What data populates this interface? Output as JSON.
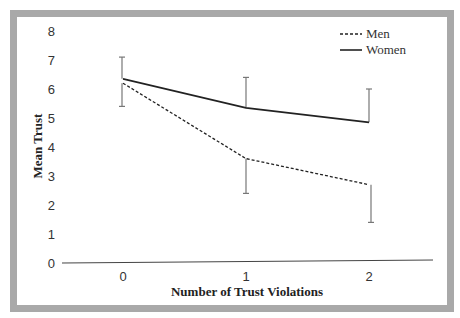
{
  "chart_data": {
    "type": "line",
    "title": "",
    "xlabel": "Number of Trust Violations",
    "ylabel": "Mean Trust",
    "x": [
      0,
      1,
      2
    ],
    "categories": [
      "0",
      "1",
      "2"
    ],
    "ylim": [
      0,
      8
    ],
    "yticks": [
      "0",
      "1",
      "2",
      "3",
      "4",
      "5",
      "6",
      "7",
      "8"
    ],
    "grid": false,
    "legend_position": "top-right",
    "series": [
      {
        "name": "Men",
        "style": "dashed",
        "values": [
          6.2,
          3.6,
          2.7
        ],
        "error_bar_ends": [
          5.4,
          2.4,
          1.4
        ]
      },
      {
        "name": "Women",
        "style": "solid",
        "values": [
          6.35,
          5.35,
          4.85
        ],
        "error_bar_ends": [
          7.1,
          6.4,
          6.0
        ]
      }
    ]
  },
  "legend": {
    "men_label": "Men",
    "women_label": "Women"
  },
  "colors": {
    "frame": "#a9a9a9",
    "line": "#222222",
    "error_bar": "#777777",
    "axis": "#444444"
  }
}
